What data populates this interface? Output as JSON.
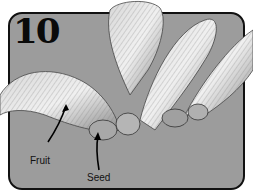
{
  "figure": {
    "number": "10",
    "labels": {
      "fruit": "Fruit",
      "seed": "Seed"
    },
    "colors": {
      "background": "#9c9c9c",
      "border": "#111111",
      "wing_light": "#e4e4e4",
      "wing_dark": "#555555"
    }
  }
}
